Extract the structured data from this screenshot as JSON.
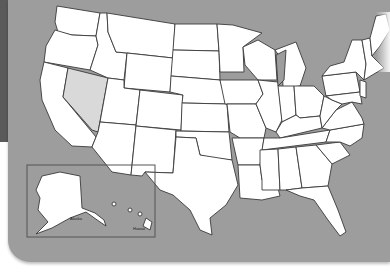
{
  "map": {
    "title": "United States blank outline map",
    "highlighted_state": "Nevada",
    "colors": {
      "background": "#9d9d9d",
      "state_fill": "#ffffff",
      "highlight_fill": "#d9d9d9",
      "border": "#3a3a3a",
      "page": "#ffffff"
    },
    "inset": {
      "labels": {
        "alaska": "Alaska",
        "hawaii": "Hawaii"
      }
    }
  }
}
